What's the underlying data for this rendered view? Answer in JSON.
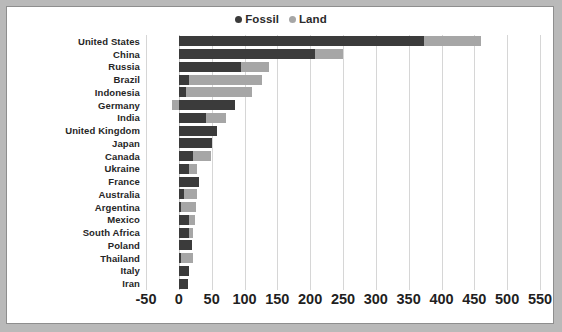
{
  "chart_data": {
    "type": "bar",
    "orientation": "horizontal",
    "stacked": true,
    "title": "",
    "xlabel": "",
    "ylabel": "",
    "xlim": [
      -50,
      550
    ],
    "xticks": [
      "-50",
      "0",
      "50",
      "100",
      "150",
      "200",
      "250",
      "300",
      "350",
      "400",
      "450",
      "500",
      "550"
    ],
    "grid": true,
    "legend_position": "top-center",
    "legend": [
      {
        "name": "Fossil",
        "marker": "circle",
        "color": "#3b3b3b"
      },
      {
        "name": "Land",
        "marker": "circle",
        "color": "#a6a6a6"
      }
    ],
    "categories": [
      "United States",
      "China",
      "Russia",
      "Brazil",
      "Indonesia",
      "Germany",
      "India",
      "United Kingdom",
      "Japan",
      "Canada",
      "Ukraine",
      "France",
      "Australia",
      "Argentina",
      "Mexico",
      "South Africa",
      "Poland",
      "Thailand",
      "Italy",
      "Iran"
    ],
    "series": [
      {
        "name": "Fossil",
        "color": "#3b3b3b",
        "values": [
          373,
          207,
          95,
          15,
          11,
          85,
          42,
          58,
          51,
          22,
          15,
          30,
          8,
          3,
          15,
          15,
          20,
          4,
          15,
          14
        ]
      },
      {
        "name": "Land",
        "color": "#a6a6a6",
        "values": [
          87,
          43,
          42,
          111,
          100,
          -10,
          30,
          0,
          0,
          27,
          12,
          0,
          19,
          23,
          9,
          7,
          0,
          18,
          0,
          0
        ]
      }
    ]
  }
}
